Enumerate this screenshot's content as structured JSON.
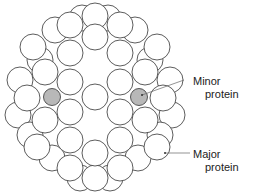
{
  "diagram": {
    "title": "",
    "labels": {
      "minor": {
        "line1": "Minor",
        "line2": "protein"
      },
      "major": {
        "line1": "Major",
        "line2": "protein"
      }
    },
    "colors": {
      "stroke": "#333333",
      "fill": "#ffffff",
      "minor_fill": "#b8b8b8"
    },
    "back_circles": [
      [
        82,
        18
      ],
      [
        108,
        18
      ],
      [
        55,
        30
      ],
      [
        135,
        30
      ],
      [
        40,
        60
      ],
      [
        150,
        60
      ],
      [
        20,
        80
      ],
      [
        170,
        80
      ],
      [
        18,
        115
      ],
      [
        172,
        115
      ],
      [
        30,
        135
      ],
      [
        160,
        135
      ],
      [
        52,
        158
      ],
      [
        138,
        158
      ],
      [
        80,
        178
      ],
      [
        110,
        178
      ],
      [
        95,
        16
      ],
      [
        95,
        178
      ]
    ],
    "major_circles": [
      [
        70,
        25
      ],
      [
        120,
        25
      ],
      [
        95,
        37
      ],
      [
        33,
        47
      ],
      [
        157,
        47
      ],
      [
        70,
        53
      ],
      [
        120,
        53
      ],
      [
        45,
        72
      ],
      [
        145,
        72
      ],
      [
        70,
        82
      ],
      [
        120,
        82
      ],
      [
        95,
        97
      ],
      [
        27,
        98
      ],
      [
        163,
        98
      ],
      [
        45,
        120
      ],
      [
        145,
        120
      ],
      [
        70,
        112
      ],
      [
        120,
        112
      ],
      [
        70,
        140
      ],
      [
        120,
        140
      ],
      [
        37,
        147
      ],
      [
        157,
        147
      ],
      [
        95,
        153
      ],
      [
        70,
        168
      ],
      [
        120,
        168
      ]
    ],
    "minor_circles": [
      [
        52,
        97
      ],
      [
        139,
        97
      ]
    ]
  }
}
